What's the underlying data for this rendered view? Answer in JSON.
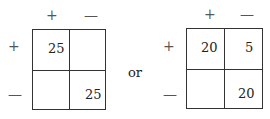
{
  "tables": [
    {
      "col_headers": [
        "+",
        "—"
      ],
      "row_headers": [
        "+",
        "—"
      ],
      "cells": [
        [
          "25",
          ""
        ],
        [
          "",
          "25"
        ]
      ]
    },
    {
      "col_headers": [
        "+",
        "—"
      ],
      "row_headers": [
        "+",
        "—"
      ],
      "cells": [
        [
          "20",
          "5"
        ],
        [
          "",
          "20"
        ]
      ]
    }
  ],
  "connector": "or"
}
